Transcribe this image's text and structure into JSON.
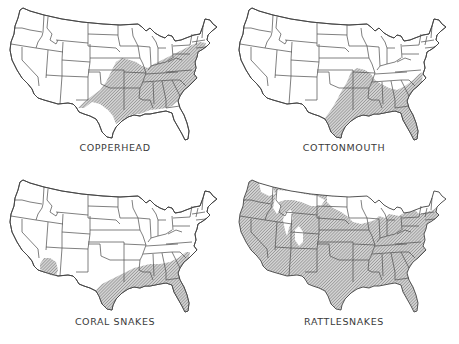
{
  "figure": {
    "hatch_color": "#8a8a8a",
    "line_color": "#555555",
    "maps": [
      {
        "id": "copperhead",
        "label": "COPPERHEAD",
        "range_description": "Eastern and southeastern U.S., from southern New England through the Appalachians, Ohio Valley, Missouri, eastern Kansas/Oklahoma into central and west Texas; absent from peninsular Florida"
      },
      {
        "id": "cottonmouth",
        "label": "COTTONMOUTH",
        "range_description": "Southeastern coastal plain from Virginia through Florida, the Gulf states, lower Mississippi Valley north to southern Illinois/Missouri, into eastern and central Texas"
      },
      {
        "id": "coral-snakes",
        "label": "CORAL  SNAKES",
        "range_description": "Southeastern coastal plain from North Carolina to Florida and the Gulf coast into south and central Texas; separate range in southern Arizona / southwestern New Mexico"
      },
      {
        "id": "rattlesnakes",
        "label": "RATTLESNAKES",
        "range_description": "Nearly all of the contiguous United States except parts of the northern Rockies, the upper Great Lakes region, northern New England and Maine"
      }
    ]
  }
}
